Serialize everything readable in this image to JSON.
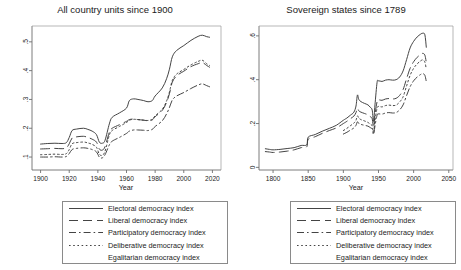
{
  "figure": {
    "width": 461,
    "height": 270,
    "background": "#ffffff",
    "line_color": "#3a3a3a",
    "axis_color": "#6e6e6e"
  },
  "panels": [
    {
      "id": "all-country-units",
      "title": "All country units since 1900",
      "xlabel": "Year",
      "ylabel": "",
      "xlim": [
        1894,
        2026
      ],
      "ylim": [
        0.055,
        0.555
      ],
      "xticks": [
        1900,
        1920,
        1940,
        1960,
        1980,
        2000,
        2020
      ],
      "xticklabels": [
        "1900",
        "1920",
        "1940",
        "1960",
        "1980",
        "2000",
        "2020"
      ],
      "yticks": [
        0.1,
        0.2,
        0.3,
        0.4,
        0.5
      ],
      "yticklabels": [
        ".1",
        ".2",
        ".3",
        ".4",
        ".5"
      ]
    },
    {
      "id": "sovereign-states",
      "title": "Sovereign states since 1789",
      "xlabel": "Year",
      "ylabel": "",
      "xlim": [
        1780,
        2056
      ],
      "ylim": [
        -0.012,
        0.645
      ],
      "xticks": [
        1800,
        1850,
        1900,
        1950,
        2000,
        2050
      ],
      "xticklabels": [
        "1800",
        "1850",
        "1900",
        "1950",
        "2000",
        "2050"
      ],
      "yticks": [
        0,
        0.2,
        0.4,
        0.6
      ],
      "yticklabels": [
        "0",
        ".2",
        ".4",
        ".6"
      ]
    }
  ],
  "legend": {
    "entries": [
      {
        "label": "Electoral democracy index",
        "style": "solid",
        "dash": "none"
      },
      {
        "label": "Liberal democracy index",
        "style": "long-dash",
        "dash": "9,5"
      },
      {
        "label": "Participatory democracy index",
        "style": "dash-dot",
        "dash": "7,3,1.6,3"
      },
      {
        "label": "Deliberative democracy index",
        "style": "dotted",
        "dash": "1.6,2.6"
      },
      {
        "label": "Egalitarian democracy index",
        "style": "blank",
        "dash": "0,40"
      }
    ]
  },
  "chart_data": {
    "type": "line",
    "xlabel": "Year",
    "ylabel": "",
    "grid": false,
    "legend_position": "below-each-panel",
    "panels": [
      {
        "name": "All country units since 1900",
        "xlim": [
          1894,
          2026
        ],
        "ylim": [
          0.055,
          0.555
        ],
        "series": [
          {
            "name": "Electoral democracy index",
            "x": [
              1900,
              1905,
              1910,
              1915,
              1918,
              1920,
              1922,
              1925,
              1930,
              1933,
              1936,
              1939,
              1941,
              1943,
              1945,
              1948,
              1950,
              1955,
              1960,
              1962,
              1965,
              1968,
              1972,
              1975,
              1978,
              1980,
              1985,
              1988,
              1990,
              1992,
              1995,
              2000,
              2005,
              2010,
              2013,
              2016,
              2018
            ],
            "values": [
              0.145,
              0.147,
              0.148,
              0.147,
              0.15,
              0.168,
              0.192,
              0.197,
              0.2,
              0.196,
              0.19,
              0.178,
              0.152,
              0.148,
              0.158,
              0.215,
              0.238,
              0.253,
              0.27,
              0.296,
              0.302,
              0.3,
              0.296,
              0.292,
              0.296,
              0.312,
              0.34,
              0.372,
              0.405,
              0.448,
              0.47,
              0.487,
              0.505,
              0.519,
              0.523,
              0.518,
              0.516
            ]
          },
          {
            "name": "Liberal democracy index",
            "x": [
              1900,
              1905,
              1910,
              1915,
              1918,
              1920,
              1922,
              1925,
              1930,
              1933,
              1936,
              1939,
              1941,
              1943,
              1945,
              1948,
              1950,
              1955,
              1960,
              1962,
              1965,
              1968,
              1972,
              1975,
              1978,
              1980,
              1985,
              1988,
              1990,
              1992,
              1995,
              2000,
              2005,
              2010,
              2013,
              2016,
              2018
            ],
            "values": [
              0.128,
              0.129,
              0.13,
              0.129,
              0.132,
              0.146,
              0.166,
              0.17,
              0.172,
              0.168,
              0.162,
              0.152,
              0.128,
              0.124,
              0.136,
              0.186,
              0.2,
              0.212,
              0.224,
              0.23,
              0.232,
              0.23,
              0.228,
              0.226,
              0.229,
              0.24,
              0.262,
              0.29,
              0.32,
              0.36,
              0.382,
              0.398,
              0.414,
              0.424,
              0.428,
              0.418,
              0.412
            ]
          },
          {
            "name": "Participatory democracy index",
            "x": [
              1900,
              1905,
              1910,
              1915,
              1918,
              1920,
              1922,
              1925,
              1930,
              1933,
              1936,
              1939,
              1941,
              1943,
              1945,
              1948,
              1950,
              1955,
              1960,
              1962,
              1965,
              1968,
              1972,
              1975,
              1978,
              1980,
              1985,
              1988,
              1990,
              1992,
              1995,
              2000,
              2005,
              2010,
              2013,
              2016,
              2018
            ],
            "values": [
              0.1,
              0.1,
              0.101,
              0.1,
              0.102,
              0.112,
              0.126,
              0.13,
              0.132,
              0.13,
              0.126,
              0.118,
              0.1,
              0.097,
              0.108,
              0.142,
              0.155,
              0.168,
              0.182,
              0.19,
              0.194,
              0.194,
              0.193,
              0.192,
              0.196,
              0.206,
              0.226,
              0.25,
              0.272,
              0.298,
              0.312,
              0.324,
              0.338,
              0.35,
              0.354,
              0.348,
              0.344
            ]
          },
          {
            "name": "Deliberative democracy index",
            "x": [
              1900,
              1905,
              1910,
              1915,
              1918,
              1920,
              1922,
              1925,
              1930,
              1933,
              1936,
              1939,
              1941,
              1943,
              1945,
              1948,
              1950,
              1955,
              1960,
              1962,
              1965,
              1968,
              1972,
              1975,
              1978,
              1980,
              1985,
              1988,
              1990,
              1992,
              1995,
              2000,
              2005,
              2010,
              2013,
              2016,
              2018
            ],
            "values": [
              0.108,
              0.109,
              0.11,
              0.109,
              0.112,
              0.126,
              0.146,
              0.15,
              0.152,
              0.149,
              0.144,
              0.134,
              0.11,
              0.106,
              0.12,
              0.176,
              0.192,
              0.206,
              0.22,
              0.228,
              0.231,
              0.23,
              0.228,
              0.227,
              0.231,
              0.243,
              0.266,
              0.295,
              0.326,
              0.366,
              0.388,
              0.404,
              0.42,
              0.432,
              0.436,
              0.424,
              0.418
            ]
          },
          {
            "name": "Egalitarian democracy index",
            "x": [
              1900,
              2018
            ],
            "values": [
              null,
              null
            ]
          }
        ]
      },
      {
        "name": "Sovereign states since 1789",
        "xlim": [
          1780,
          2056
        ],
        "ylim": [
          -0.012,
          0.645
        ],
        "series": [
          {
            "name": "Electoral democracy index",
            "x": [
              1789,
              1795,
              1800,
              1810,
              1820,
              1830,
              1840,
              1848,
              1850,
              1860,
              1870,
              1880,
              1890,
              1900,
              1905,
              1910,
              1915,
              1918,
              1920,
              1922,
              1925,
              1930,
              1935,
              1938,
              1941,
              1943,
              1945,
              1948,
              1950,
              1955,
              1960,
              1965,
              1970,
              1975,
              1980,
              1985,
              1990,
              1995,
              2000,
              2005,
              2010,
              2013,
              2016,
              2018
            ],
            "values": [
              0.085,
              0.082,
              0.08,
              0.082,
              0.086,
              0.09,
              0.1,
              0.103,
              0.138,
              0.15,
              0.165,
              0.178,
              0.192,
              0.215,
              0.225,
              0.238,
              0.252,
              0.28,
              0.33,
              0.31,
              0.3,
              0.292,
              0.285,
              0.275,
              0.262,
              0.21,
              0.285,
              0.388,
              0.395,
              0.392,
              0.398,
              0.4,
              0.398,
              0.4,
              0.412,
              0.44,
              0.492,
              0.545,
              0.575,
              0.595,
              0.608,
              0.612,
              0.605,
              0.548
            ]
          },
          {
            "name": "Liberal democracy index",
            "x": [
              1789,
              1795,
              1800,
              1810,
              1820,
              1830,
              1840,
              1848,
              1850,
              1860,
              1870,
              1880,
              1890,
              1900,
              1905,
              1910,
              1915,
              1918,
              1920,
              1922,
              1925,
              1930,
              1935,
              1938,
              1941,
              1943,
              1945,
              1948,
              1950,
              1955,
              1960,
              1965,
              1970,
              1975,
              1980,
              1985,
              1990,
              1995,
              2000,
              2005,
              2010,
              2013,
              2016,
              2018
            ],
            "values": [
              0.072,
              0.07,
              0.068,
              0.07,
              0.074,
              0.08,
              0.09,
              0.094,
              0.128,
              0.14,
              0.155,
              0.168,
              0.18,
              0.2,
              0.21,
              0.222,
              0.234,
              0.25,
              0.27,
              0.258,
              0.252,
              0.246,
              0.24,
              0.232,
              0.222,
              0.182,
              0.24,
              0.3,
              0.308,
              0.306,
              0.312,
              0.314,
              0.312,
              0.315,
              0.328,
              0.355,
              0.405,
              0.452,
              0.482,
              0.502,
              0.515,
              0.52,
              0.512,
              0.478
            ]
          },
          {
            "name": "Participatory democracy index",
            "x": [
              1900,
              1905,
              1910,
              1915,
              1918,
              1920,
              1922,
              1925,
              1930,
              1935,
              1938,
              1941,
              1943,
              1945,
              1948,
              1950,
              1955,
              1960,
              1965,
              1970,
              1975,
              1980,
              1985,
              1990,
              1995,
              2000,
              2005,
              2010,
              2013,
              2016,
              2018
            ],
            "values": [
              0.152,
              0.16,
              0.17,
              0.18,
              0.192,
              0.208,
              0.2,
              0.196,
              0.192,
              0.188,
              0.182,
              0.175,
              0.15,
              0.19,
              0.238,
              0.244,
              0.243,
              0.248,
              0.25,
              0.248,
              0.25,
              0.262,
              0.285,
              0.328,
              0.368,
              0.395,
              0.412,
              0.424,
              0.428,
              0.42,
              0.392
            ]
          },
          {
            "name": "Deliberative democracy index",
            "x": [
              1900,
              1905,
              1910,
              1915,
              1918,
              1920,
              1922,
              1925,
              1930,
              1935,
              1938,
              1941,
              1943,
              1945,
              1948,
              1950,
              1955,
              1960,
              1965,
              1970,
              1975,
              1980,
              1985,
              1990,
              1995,
              2000,
              2005,
              2010,
              2013,
              2016,
              2018
            ],
            "values": [
              0.168,
              0.178,
              0.19,
              0.202,
              0.215,
              0.235,
              0.225,
              0.218,
              0.212,
              0.205,
              0.198,
              0.19,
              0.16,
              0.215,
              0.27,
              0.278,
              0.276,
              0.282,
              0.284,
              0.282,
              0.284,
              0.298,
              0.322,
              0.372,
              0.42,
              0.452,
              0.472,
              0.486,
              0.49,
              0.48,
              0.448
            ]
          },
          {
            "name": "Egalitarian democracy index",
            "x": [
              1789,
              2018
            ],
            "values": [
              null,
              null
            ]
          }
        ]
      }
    ]
  }
}
